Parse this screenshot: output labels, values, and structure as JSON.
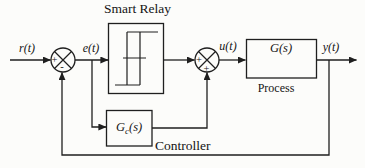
{
  "figure": {
    "type": "control-system-block-diagram",
    "colors": {
      "background": "#fcfcfa",
      "line": "#1f1f1f",
      "text": "#141414"
    },
    "blocks": {
      "relay": {
        "title": "Smart Relay"
      },
      "process": {
        "label": "G(s)",
        "caption": "Process"
      },
      "controller": {
        "label_base": "G",
        "label_sub": "c",
        "label_args": "(s)",
        "caption": "Controller"
      }
    },
    "signals": {
      "reference": "r(t)",
      "error": "e(t)",
      "control": "u(t)",
      "output": "y(t)"
    },
    "junctions": {
      "input_sum": {
        "left_sign": "+",
        "bottom_sign": "-"
      },
      "control_sum": {
        "left_sign": "+",
        "bottom_sign": "+"
      }
    }
  }
}
